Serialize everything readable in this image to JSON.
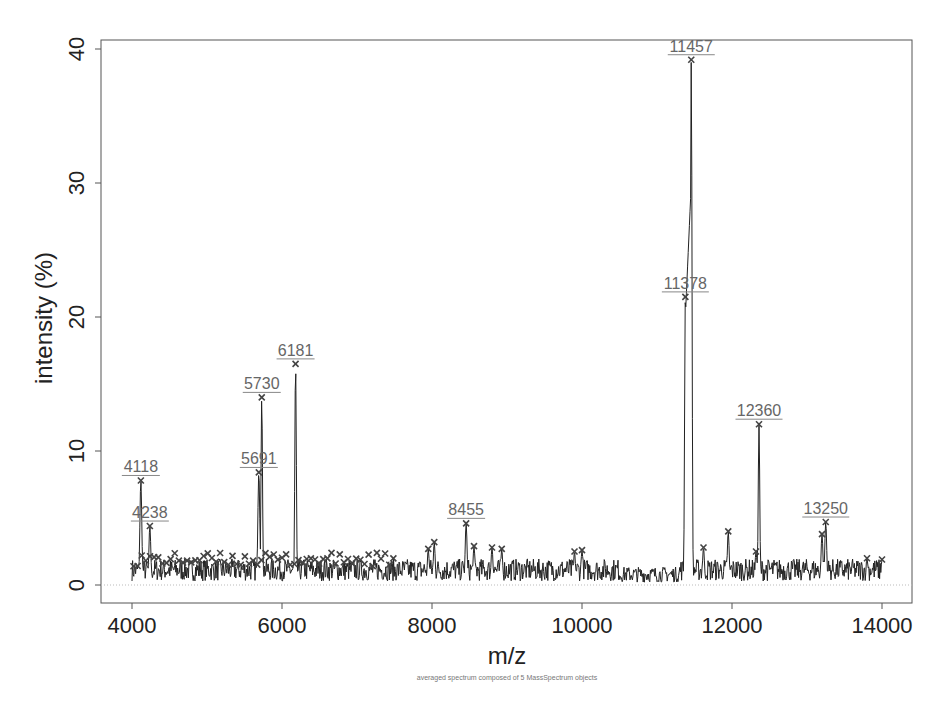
{
  "chart_data": {
    "type": "line",
    "title": "",
    "subtitle": "averaged spectrum composed of 5 MassSpectrum objects",
    "xlabel": "m/z",
    "ylabel": "intensity (%)",
    "xlim": [
      3600,
      14400
    ],
    "ylim": [
      -1.5,
      41.5
    ],
    "xticks": [
      4000,
      6000,
      8000,
      10000,
      12000,
      14000
    ],
    "yticks": [
      0,
      10,
      20,
      30,
      40
    ],
    "grid": false,
    "legend": null,
    "baseline_noise_range": [
      0.3,
      2.5
    ],
    "labeled_peaks": [
      {
        "mz": 4118,
        "intensity": 7.8,
        "label": "4118"
      },
      {
        "mz": 4238,
        "intensity": 4.4,
        "label": "4238"
      },
      {
        "mz": 5691,
        "intensity": 8.4,
        "label": "5691"
      },
      {
        "mz": 5730,
        "intensity": 14.0,
        "label": "5730"
      },
      {
        "mz": 6181,
        "intensity": 16.5,
        "label": "6181"
      },
      {
        "mz": 8455,
        "intensity": 4.6,
        "label": "8455"
      },
      {
        "mz": 11378,
        "intensity": 21.5,
        "label": "11378"
      },
      {
        "mz": 11457,
        "intensity": 39.2,
        "label": "11457"
      },
      {
        "mz": 12360,
        "intensity": 12.0,
        "label": "12360"
      },
      {
        "mz": 13250,
        "intensity": 4.7,
        "label": "13250"
      }
    ],
    "minor_peaks": [
      {
        "mz": 7950,
        "intensity": 2.7
      },
      {
        "mz": 8030,
        "intensity": 3.2
      },
      {
        "mz": 8560,
        "intensity": 2.9
      },
      {
        "mz": 8800,
        "intensity": 2.8
      },
      {
        "mz": 8930,
        "intensity": 2.7
      },
      {
        "mz": 9900,
        "intensity": 2.5
      },
      {
        "mz": 10000,
        "intensity": 2.6
      },
      {
        "mz": 11620,
        "intensity": 2.8
      },
      {
        "mz": 11950,
        "intensity": 4.0
      },
      {
        "mz": 12320,
        "intensity": 2.5
      },
      {
        "mz": 13200,
        "intensity": 3.8
      },
      {
        "mz": 13800,
        "intensity": 2.0
      },
      {
        "mz": 14000,
        "intensity": 1.9
      }
    ]
  }
}
